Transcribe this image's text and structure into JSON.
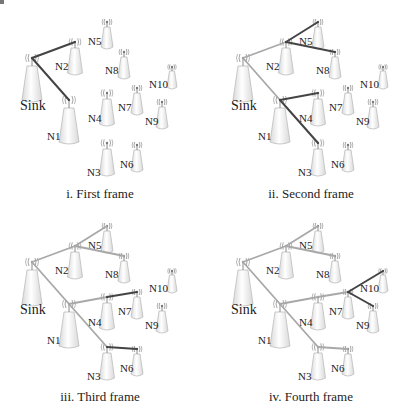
{
  "figure": {
    "colors": {
      "new_link": "#444444",
      "old_link": "#a8a8a8",
      "tower_fill_light": "#ffffff",
      "tower_fill_dark": "#d9d9d9",
      "tower_stroke": "#bdbdbd",
      "wave": "#9a9a9a"
    },
    "nodes": [
      {
        "id": "Sink",
        "label": "Sink",
        "x": 32,
        "y": 58,
        "size": "large",
        "lx": 20,
        "ly": 110
      },
      {
        "id": "N1",
        "label": "N1",
        "x": 69,
        "y": 100,
        "size": "large",
        "lx": 47,
        "ly": 140
      },
      {
        "id": "N2",
        "label": "N2",
        "x": 75,
        "y": 42,
        "size": "medium",
        "lx": 55,
        "ly": 70
      },
      {
        "id": "N3",
        "label": "N3",
        "x": 107,
        "y": 143,
        "size": "medium",
        "lx": 87,
        "ly": 176
      },
      {
        "id": "N4",
        "label": "N4",
        "x": 107,
        "y": 93,
        "size": "medium",
        "lx": 88,
        "ly": 122
      },
      {
        "id": "N5",
        "label": "N5",
        "x": 107,
        "y": 22,
        "size": "small",
        "lx": 88,
        "ly": 45
      },
      {
        "id": "N6",
        "label": "N6",
        "x": 137,
        "y": 145,
        "size": "small",
        "lx": 120,
        "ly": 168
      },
      {
        "id": "N7",
        "label": "N7",
        "x": 137,
        "y": 88,
        "size": "small",
        "lx": 118,
        "ly": 111
      },
      {
        "id": "N8",
        "label": "N8",
        "x": 124,
        "y": 52,
        "size": "small",
        "lx": 105,
        "ly": 74
      },
      {
        "id": "N9",
        "label": "N9",
        "x": 162,
        "y": 102,
        "size": "small",
        "lx": 145,
        "ly": 125
      },
      {
        "id": "N10",
        "label": "N10",
        "x": 172,
        "y": 67,
        "size": "tiny",
        "lx": 149,
        "ly": 88
      }
    ],
    "frames": [
      {
        "caption": "i. First frame",
        "offset": [
          0,
          0
        ],
        "links": [
          {
            "from": "Sink",
            "to": "N2",
            "state": "new"
          },
          {
            "from": "Sink",
            "to": "N1",
            "state": "new"
          }
        ]
      },
      {
        "caption": "ii. Second frame",
        "offset": [
          211,
          0
        ],
        "links": [
          {
            "from": "Sink",
            "to": "N2",
            "state": "old"
          },
          {
            "from": "Sink",
            "to": "N1",
            "state": "old"
          },
          {
            "from": "N2",
            "to": "N5",
            "state": "new"
          },
          {
            "from": "N2",
            "to": "N8",
            "state": "new"
          },
          {
            "from": "N1",
            "to": "N4",
            "state": "new"
          },
          {
            "from": "N1",
            "to": "N3",
            "state": "new"
          }
        ]
      },
      {
        "caption": "iii. Third frame",
        "offset": [
          0,
          204
        ],
        "links": [
          {
            "from": "Sink",
            "to": "N2",
            "state": "old"
          },
          {
            "from": "Sink",
            "to": "N1",
            "state": "old"
          },
          {
            "from": "N2",
            "to": "N5",
            "state": "old"
          },
          {
            "from": "N2",
            "to": "N8",
            "state": "old"
          },
          {
            "from": "N1",
            "to": "N4",
            "state": "old"
          },
          {
            "from": "N1",
            "to": "N3",
            "state": "old"
          },
          {
            "from": "N4",
            "to": "N7",
            "state": "new"
          },
          {
            "from": "N3",
            "to": "N6",
            "state": "new"
          }
        ]
      },
      {
        "caption": "iv. Fourth frame",
        "offset": [
          211,
          204
        ],
        "links": [
          {
            "from": "Sink",
            "to": "N2",
            "state": "old"
          },
          {
            "from": "Sink",
            "to": "N1",
            "state": "old"
          },
          {
            "from": "N2",
            "to": "N5",
            "state": "old"
          },
          {
            "from": "N2",
            "to": "N8",
            "state": "old"
          },
          {
            "from": "N1",
            "to": "N4",
            "state": "old"
          },
          {
            "from": "N1",
            "to": "N3",
            "state": "old"
          },
          {
            "from": "N4",
            "to": "N7",
            "state": "old"
          },
          {
            "from": "N3",
            "to": "N6",
            "state": "old"
          },
          {
            "from": "N7",
            "to": "N10",
            "state": "new"
          },
          {
            "from": "N7",
            "to": "N9",
            "state": "new"
          }
        ]
      }
    ]
  }
}
